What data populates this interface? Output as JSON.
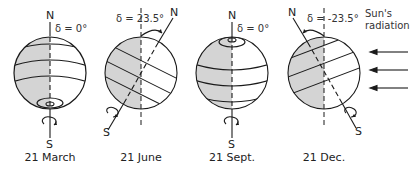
{
  "globes": [
    {
      "date": "21 March",
      "declination": "δ = 0°",
      "north": "N",
      "south": "S"
    },
    {
      "date": "21 June",
      "declination": "δ = 23.5°",
      "north": "N",
      "south": "S"
    },
    {
      "date": "21 Sept.",
      "declination": "δ = 0°",
      "north": "N",
      "south": "S"
    },
    {
      "date": "21 Dec.",
      "declination": "δ = -23.5°",
      "north": "N",
      "south": "S"
    }
  ],
  "sun": {
    "line1": "Sun's",
    "line2": "radiation",
    "arrow_count": 3
  },
  "colors": {
    "shade": "#d4d4d4",
    "line": "#1a1a1a"
  }
}
